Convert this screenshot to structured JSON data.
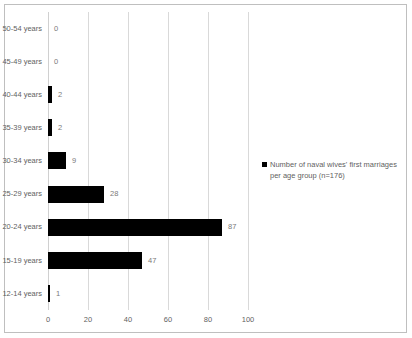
{
  "chart_data": {
    "type": "bar",
    "orientation": "horizontal",
    "title": "",
    "xlabel": "",
    "ylabel": "",
    "categories": [
      "50-54 years",
      "45-49 years",
      "40-44 years",
      "35-39 years",
      "30-34 years",
      "25-29 years",
      "20-24 years",
      "15-19 years",
      "12-14 years"
    ],
    "values": [
      0,
      0,
      2,
      2,
      9,
      28,
      87,
      47,
      1
    ],
    "data_labels": [
      "0",
      "0",
      "2",
      "2",
      "9",
      "28",
      "87",
      "47",
      "1"
    ],
    "series": [
      {
        "name": "Number of naval wives' first marriages per age group (n=176)",
        "values": [
          0,
          0,
          2,
          2,
          9,
          28,
          87,
          47,
          1
        ],
        "color": "#000000"
      }
    ],
    "xlim": [
      0,
      100
    ],
    "x_ticks": [
      0,
      20,
      40,
      60,
      80,
      100
    ],
    "x_tick_labels": [
      "0",
      "20",
      "40",
      "60",
      "80",
      "100"
    ],
    "grid": true,
    "grid_axis": "x",
    "legend_position": "right",
    "bar_color": "#000000",
    "gridline_color": "#d9d9d9",
    "label_color": "#5f5f5f",
    "background_color": "#ffffff",
    "border_color": "#bfbfbf"
  },
  "legend": {
    "marker": "square-marker",
    "text": "Number of naval wives' first marriages per age group (n=176)"
  }
}
